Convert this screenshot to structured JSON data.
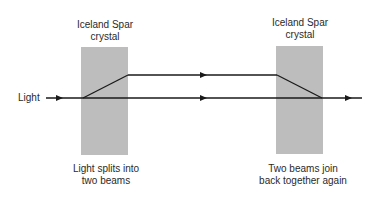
{
  "labels": {
    "crystal_left": [
      "Iceland Spar",
      "crystal"
    ],
    "crystal_right": [
      "Iceland Spar",
      "crystal"
    ],
    "light": "Light",
    "caption_left": [
      "Light splits into",
      "two beams"
    ],
    "caption_right": [
      "Two beams join",
      "back together again"
    ]
  },
  "colors": {
    "crystal_fill": "#bdbdbd",
    "beam": "#1a1a1a",
    "text": "#2a2a2a"
  },
  "geometry": {
    "crystals": [
      {
        "x": 81,
        "y": 47,
        "w": 47,
        "h": 108
      },
      {
        "x": 276,
        "y": 46,
        "w": 47,
        "h": 108
      }
    ],
    "bottom_beam": {
      "x1": 46,
      "x2": 362,
      "y": 98
    },
    "top_beam": {
      "x1": 128,
      "x2": 277,
      "y": 75
    },
    "split": {
      "x1": 83,
      "y1": 98,
      "x2": 128,
      "y2": 75
    },
    "join": {
      "x1": 277,
      "y1": 75,
      "x2": 322,
      "y2": 98
    },
    "arrows": [
      {
        "x": 61,
        "y": 98
      },
      {
        "x": 204,
        "y": 75
      },
      {
        "x": 204,
        "y": 98
      },
      {
        "x": 349,
        "y": 98
      }
    ]
  }
}
